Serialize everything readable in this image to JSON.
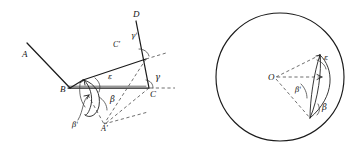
{
  "figure": {
    "background_color": "#ffffff",
    "stroke_color": "#1b1b1b",
    "dash_color": "#4a4a4a",
    "panels": [
      {
        "id": "left-panel",
        "kind": "spherical-triangle-unfolding-diagram",
        "labels": [
          {
            "key": "A",
            "text": "A",
            "x": 22,
            "y": 57
          },
          {
            "key": "B",
            "text": "B",
            "x": 60,
            "y": 92
          },
          {
            "key": "C",
            "text": "C",
            "x": 150,
            "y": 97
          },
          {
            "key": "D",
            "text": "D",
            "x": 133,
            "y": 17
          },
          {
            "key": "Cprime",
            "text": "C'",
            "x": 113,
            "y": 47
          },
          {
            "key": "Aprime",
            "text": "A'",
            "x": 101,
            "y": 131
          },
          {
            "key": "gamma",
            "text": "γ",
            "x": 155,
            "y": 80
          },
          {
            "key": "gammap",
            "text": "γ'",
            "x": 131,
            "y": 38
          },
          {
            "key": "beta",
            "text": "β",
            "x": 110,
            "y": 102
          },
          {
            "key": "betap",
            "text": "β'",
            "x": 72,
            "y": 127
          },
          {
            "key": "epsilon",
            "text": "ε",
            "x": 108,
            "y": 79
          }
        ]
      },
      {
        "id": "right-panel",
        "kind": "great-circle-lune-diagram",
        "circle": {
          "cx": 280,
          "cy": 77,
          "r": 64
        },
        "labels": [
          {
            "key": "O",
            "text": "O",
            "x": 268,
            "y": 80
          },
          {
            "key": "epsilon",
            "text": "ε",
            "x": 324,
            "y": 60
          },
          {
            "key": "beta",
            "text": "β",
            "x": 322,
            "y": 110
          },
          {
            "key": "betap",
            "text": "β'",
            "x": 295,
            "y": 92
          }
        ]
      }
    ]
  }
}
